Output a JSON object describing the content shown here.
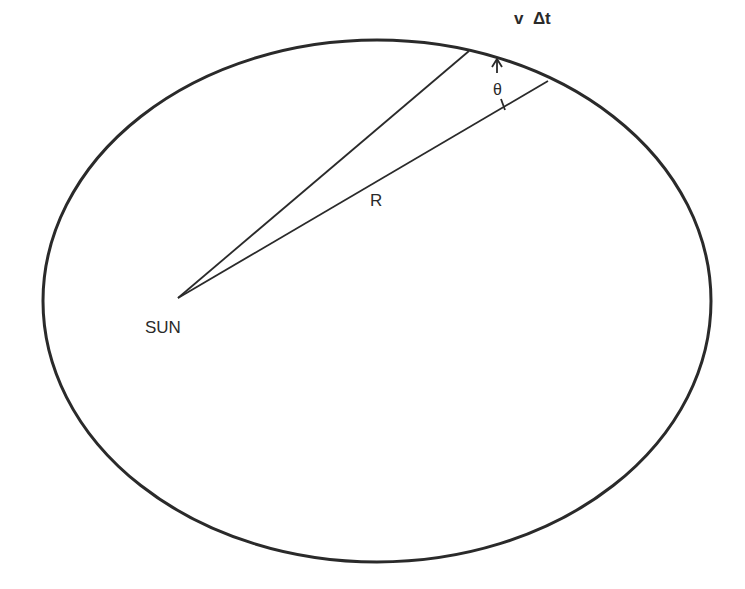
{
  "diagram": {
    "colors": {
      "stroke": "#2a2a2a",
      "background": "#ffffff"
    },
    "orbit": {
      "cx": 377,
      "cy": 301,
      "rx": 334,
      "ry": 261
    },
    "sun": {
      "x": 178,
      "y": 298
    },
    "labels": {
      "sun": "SUN",
      "radius": "R",
      "angle": "θ",
      "arc": "v  Δt"
    }
  }
}
